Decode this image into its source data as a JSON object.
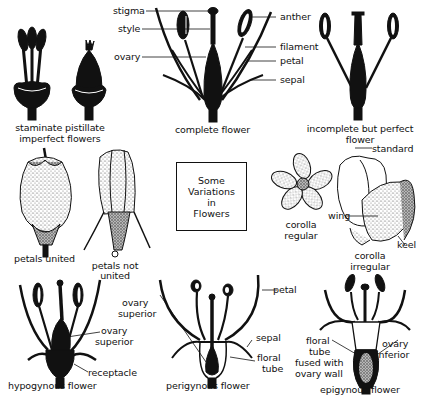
{
  "figure": {
    "title_lines": [
      "Some",
      "Variations",
      "in",
      "Flowers"
    ]
  },
  "panels": {
    "imperfect": {
      "caption_line1": "staminate pistillate",
      "caption_line2": "imperfect flowers"
    },
    "complete": {
      "caption": "complete flower",
      "labels": {
        "stigma": "stigma",
        "style": "style",
        "ovary": "ovary",
        "anther": "anther",
        "filament": "filament",
        "petal": "petal",
        "sepal": "sepal"
      }
    },
    "incomplete": {
      "caption_line1": "incomplete but perfect",
      "caption_line2": "flower"
    },
    "petals_united": {
      "caption": "petals united"
    },
    "petals_not_united": {
      "caption_line1": "petals not",
      "caption_line2": "united"
    },
    "corolla_regular": {
      "caption_line1": "corolla",
      "caption_line2": "regular"
    },
    "corolla_irregular": {
      "caption_line1": "corolla",
      "caption_line2": "irregular",
      "labels": {
        "standard": "standard",
        "wing": "wing",
        "keel": "keel"
      }
    },
    "hypogynous": {
      "caption": "hypogynous flower",
      "labels": {
        "ovary_superior_line1": "ovary",
        "ovary_superior_line2": "superior",
        "receptacle": "receptacle"
      }
    },
    "perigynous": {
      "caption": "perigynous flower",
      "labels": {
        "ovary_superior_line1": "ovary",
        "ovary_superior_line2": "superior",
        "petal": "petal",
        "sepal": "sepal",
        "floral_tube_line1": "floral",
        "floral_tube_line2": "tube"
      }
    },
    "epigynous": {
      "caption": "epigynous flower",
      "labels": {
        "floral_tube_line1": "floral",
        "floral_tube_line2": "tube",
        "fused_line1": "fused with",
        "fused_line2": "ovary wall",
        "ovary_inferior_line1": "ovary",
        "ovary_inferior_line2": "inferior"
      }
    }
  },
  "colors": {
    "ink": "#111111",
    "background": "#ffffff",
    "stipple": "#d8d8d8"
  }
}
